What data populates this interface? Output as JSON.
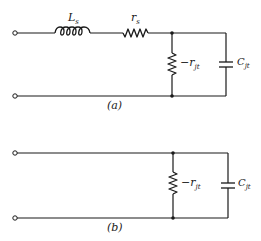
{
  "diagram": {
    "type": "circuit-schematic",
    "circuits": [
      {
        "id": "a",
        "caption": "(a)",
        "components": {
          "inductor": {
            "label_main": "L",
            "label_sub": "s"
          },
          "series_resistor": {
            "label_main": "r",
            "label_sub": "s"
          },
          "negative_resistor": {
            "label_main": "−r",
            "label_sub": "jt"
          },
          "capacitor": {
            "label_main": "C",
            "label_sub": "jt"
          }
        }
      },
      {
        "id": "b",
        "caption": "(b)",
        "components": {
          "negative_resistor": {
            "label_main": "−r",
            "label_sub": "jt"
          },
          "capacitor": {
            "label_main": "C",
            "label_sub": "jt"
          }
        }
      }
    ]
  }
}
